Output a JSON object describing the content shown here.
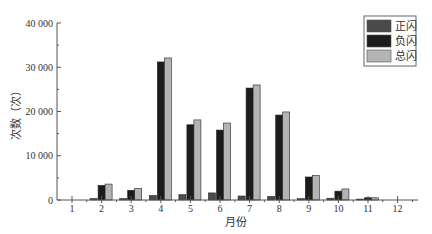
{
  "chart_data": {
    "type": "bar",
    "title": "",
    "xlabel": "月份",
    "ylabel": "次数（次）",
    "categories": [
      "1",
      "2",
      "3",
      "4",
      "5",
      "6",
      "7",
      "8",
      "9",
      "10",
      "11",
      "12"
    ],
    "series": [
      {
        "name": "正闪",
        "color": "#4a4a4a",
        "values": [
          0,
          300,
          300,
          1000,
          1200,
          1600,
          900,
          800,
          300,
          400,
          200,
          0
        ]
      },
      {
        "name": "负闪",
        "color": "#1c1c1c",
        "values": [
          0,
          3300,
          2200,
          31200,
          17000,
          15800,
          25300,
          19200,
          5200,
          2000,
          500,
          0
        ]
      },
      {
        "name": "总闪",
        "color": "#b4b4b4",
        "values": [
          0,
          3600,
          2600,
          32100,
          18100,
          17400,
          26000,
          19900,
          5500,
          2500,
          500,
          0
        ]
      }
    ],
    "ylim": [
      0,
      40000
    ],
    "yticks": [
      0,
      10000,
      20000,
      30000,
      40000
    ],
    "ytick_labels": [
      "0",
      "10 000",
      "20 000",
      "30 000",
      "40 000"
    ],
    "grid": false,
    "legend_position": "upper right"
  }
}
